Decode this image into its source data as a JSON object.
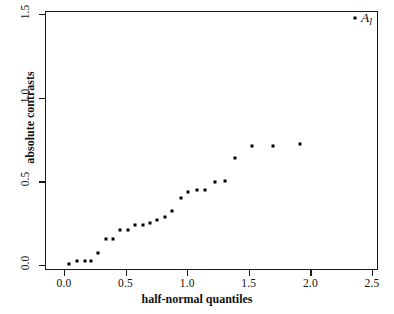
{
  "chart_data": {
    "type": "scatter",
    "title": "",
    "xlabel": "half-normal quantiles",
    "ylabel": "absolute contrasts",
    "xlim": [
      -0.15,
      2.65
    ],
    "ylim": [
      -0.06,
      1.55
    ],
    "xticks": [
      "0.0",
      "0.5",
      "1.0",
      "1.5",
      "2.0",
      "2.5"
    ],
    "xtick_values": [
      0.0,
      0.5,
      1.0,
      1.5,
      2.0,
      2.5
    ],
    "yticks": [
      "0.0",
      "0.5",
      "1.0",
      "1.5"
    ],
    "ytick_values": [
      0.0,
      0.5,
      1.0,
      1.5
    ],
    "grid": false,
    "legend": "none",
    "marker": "filled-square",
    "marker_color": "#000000",
    "points": [
      {
        "x": 0.03,
        "y": 0.012
      },
      {
        "x": 0.1,
        "y": 0.028
      },
      {
        "x": 0.16,
        "y": 0.03
      },
      {
        "x": 0.21,
        "y": 0.03
      },
      {
        "x": 0.27,
        "y": 0.078
      },
      {
        "x": 0.33,
        "y": 0.16
      },
      {
        "x": 0.39,
        "y": 0.16
      },
      {
        "x": 0.45,
        "y": 0.215
      },
      {
        "x": 0.51,
        "y": 0.218
      },
      {
        "x": 0.57,
        "y": 0.245
      },
      {
        "x": 0.63,
        "y": 0.248
      },
      {
        "x": 0.69,
        "y": 0.255
      },
      {
        "x": 0.75,
        "y": 0.272
      },
      {
        "x": 0.81,
        "y": 0.295
      },
      {
        "x": 0.87,
        "y": 0.33
      },
      {
        "x": 0.94,
        "y": 0.405
      },
      {
        "x": 1.0,
        "y": 0.445
      },
      {
        "x": 1.07,
        "y": 0.455
      },
      {
        "x": 1.14,
        "y": 0.455
      },
      {
        "x": 1.22,
        "y": 0.5
      },
      {
        "x": 1.3,
        "y": 0.505
      },
      {
        "x": 1.38,
        "y": 0.645
      },
      {
        "x": 1.52,
        "y": 0.715
      },
      {
        "x": 1.69,
        "y": 0.715
      },
      {
        "x": 1.91,
        "y": 0.73
      },
      {
        "x": 2.35,
        "y": 1.485
      }
    ],
    "annotations": [
      {
        "name": "outlier-label",
        "text": "A",
        "subscript": "l",
        "x": 2.41,
        "y": 1.47
      }
    ]
  }
}
